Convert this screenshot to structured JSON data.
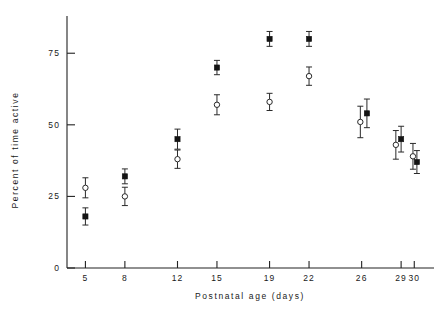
{
  "chart_data": {
    "type": "scatter",
    "title": "",
    "xlabel": "Postnatal age (days)",
    "ylabel": "Percent of time active",
    "xlim": [
      3.6,
      31.5
    ],
    "ylim": [
      0,
      88
    ],
    "grid": false,
    "legend_position": "none",
    "xticks": [
      5,
      8,
      12,
      15,
      19,
      22,
      26,
      29,
      30
    ],
    "xtick_labels": [
      "5",
      "8",
      "12",
      "15",
      "19",
      "22",
      "26",
      "29",
      "30"
    ],
    "yticks": [
      0,
      25,
      50,
      75
    ],
    "ytick_labels": [
      "0",
      "25",
      "50",
      "75"
    ],
    "series": [
      {
        "name": "filled",
        "marker": "filled-square",
        "x": [
          5,
          8,
          12,
          15,
          19,
          22,
          26.4,
          29,
          30.2
        ],
        "values": [
          18,
          32,
          45,
          70,
          80,
          80,
          54,
          45,
          37
        ],
        "err_low": [
          3.0,
          2.6,
          3.5,
          2.5,
          2.6,
          2.6,
          5.0,
          4.5,
          4.0
        ],
        "err_high": [
          3.0,
          2.6,
          3.5,
          2.5,
          2.6,
          2.6,
          5.0,
          4.5,
          4.0
        ]
      },
      {
        "name": "open",
        "marker": "open-circle",
        "x": [
          5,
          8,
          12,
          15,
          19,
          22,
          25.9,
          28.6,
          29.9
        ],
        "values": [
          28,
          25,
          38,
          57,
          58,
          67,
          51,
          43,
          39
        ],
        "err_low": [
          3.5,
          3.2,
          3.2,
          3.5,
          3.0,
          3.2,
          5.5,
          5.0,
          4.5
        ],
        "err_high": [
          3.5,
          3.2,
          3.2,
          3.5,
          3.0,
          3.2,
          5.5,
          5.0,
          4.5
        ]
      }
    ]
  },
  "axes": {
    "x_title": "Postnatal age (days)",
    "y_title": "Percent of time active"
  }
}
